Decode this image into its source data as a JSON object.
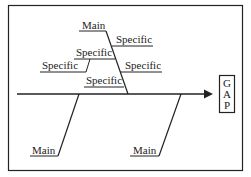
{
  "diagram": {
    "type": "fishbone",
    "effect_label": [
      "G",
      "A",
      "P"
    ],
    "main_top": "Main",
    "specifics_right": [
      "Specific",
      "Specific"
    ],
    "specifics_left": [
      "Specific",
      "Specific",
      "Specific"
    ],
    "main_bottom": [
      "Main",
      "Main"
    ]
  }
}
